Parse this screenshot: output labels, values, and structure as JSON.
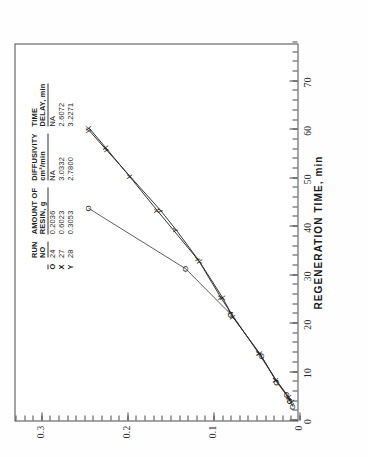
{
  "figure": {
    "background": "#ffffff",
    "frame_color": "#4a4a4a"
  },
  "axes": {
    "x_title": "REGENERATION TIME, min",
    "y_title": "",
    "x_ticks": [
      "0",
      "10",
      "20",
      "30",
      "40",
      "50",
      "60",
      "70"
    ],
    "y_ticks": [
      "0",
      "0.1",
      "0.2",
      "0.3"
    ],
    "x_min": 0,
    "x_max": 78,
    "y_min": 0,
    "y_max": 0.33
  },
  "legend": {
    "headers": {
      "run": "RUN",
      "run_sub": "NO",
      "amount": "AMOUNT OF",
      "amount_sub": "RESIN, g",
      "diffusivity": "DIFFUSIVITY",
      "diffusivity_sub": "cm²/min",
      "timedelay": "TIME",
      "timedelay_sub": "DELAY, min"
    },
    "rows": [
      {
        "symbol": "O",
        "run_no": "24",
        "amount": "0.2036",
        "diffusivity": "NA",
        "time_delay": "NA"
      },
      {
        "symbol": "X",
        "run_no": "27",
        "amount": "0.6023",
        "diffusivity": "3.0332",
        "time_delay": "2.6072"
      },
      {
        "symbol": "Y",
        "run_no": "28",
        "amount": "0.3053",
        "diffusivity": "2.7800",
        "time_delay": "3.2271"
      }
    ]
  },
  "chart_data": {
    "type": "line",
    "title": "",
    "xlabel": "REGENERATION TIME, min",
    "ylabel": "",
    "xlim": [
      0,
      78
    ],
    "ylim": [
      0,
      0.33
    ],
    "grid": false,
    "legend_position": "upper-right-inset",
    "xticks": [
      0,
      10,
      20,
      30,
      40,
      50,
      60,
      70
    ],
    "yticks": [
      0,
      0.1,
      0.2,
      0.3
    ],
    "series": [
      {
        "name": "Run 24",
        "marker": "O",
        "x": [
          3.0,
          4.2,
          5.5,
          8.0,
          13.5,
          22.0,
          31.5,
          44.0
        ],
        "y": [
          0.006,
          0.01,
          0.014,
          0.025,
          0.043,
          0.078,
          0.131,
          0.244
        ]
      },
      {
        "name": "Run 27",
        "marker": "X",
        "x": [
          4.0,
          5.0,
          8.5,
          14.0,
          21.5,
          25.5,
          33.0,
          43.5,
          50.5,
          56.5,
          60.5
        ],
        "y": [
          0.008,
          0.011,
          0.026,
          0.045,
          0.076,
          0.088,
          0.115,
          0.164,
          0.196,
          0.224,
          0.243
        ]
      },
      {
        "name": "Run 28",
        "marker": "Y",
        "x": [
          4.5,
          8.5,
          14.0,
          22.5,
          25.5,
          33.5,
          39.5,
          43.5,
          56.0,
          60.0
        ],
        "y": [
          0.01,
          0.026,
          0.046,
          0.079,
          0.09,
          0.117,
          0.142,
          0.16,
          0.223,
          0.243
        ]
      }
    ]
  }
}
